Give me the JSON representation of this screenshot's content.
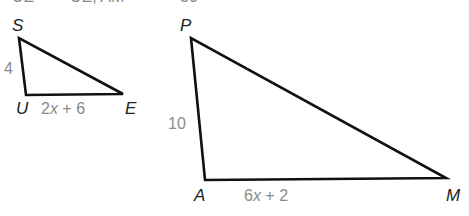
{
  "clipped_header": {
    "parts": [
      "UE",
      "=",
      "UE, AM",
      "=",
      "30"
    ]
  },
  "triangle_small": {
    "vertices": {
      "S": {
        "label": "S",
        "x": 19,
        "y": 38
      },
      "U": {
        "label": "U",
        "x": 26,
        "y": 95
      },
      "E": {
        "label": "E",
        "x": 123,
        "y": 94
      }
    },
    "side_labels": {
      "SU": "4",
      "UE": {
        "coef": "2",
        "var": "x",
        "rest": " + 6"
      }
    }
  },
  "triangle_large": {
    "vertices": {
      "P": {
        "label": "P",
        "x": 191,
        "y": 38
      },
      "A": {
        "label": "A",
        "x": 205,
        "y": 180
      },
      "M": {
        "label": "M",
        "x": 446,
        "y": 178
      }
    },
    "side_labels": {
      "PA": "10",
      "AM": {
        "coef": "6",
        "var": "x",
        "rest": " + 2"
      }
    }
  },
  "colors": {
    "stroke": "#111111",
    "vertex_label": "#222222",
    "side_label": "#8a8a8a"
  }
}
